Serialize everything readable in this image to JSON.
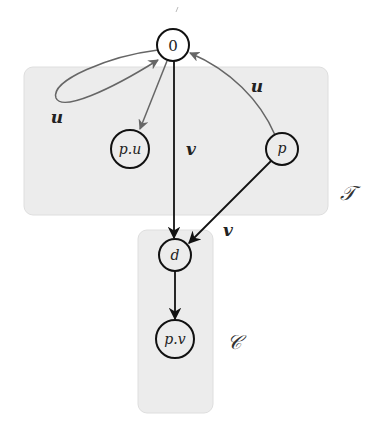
{
  "diagram": {
    "type": "directed-graph",
    "colors": {
      "region_fill": "#ececec",
      "dark_edge": "#111111",
      "gray_edge": "#666666"
    },
    "regions": [
      {
        "id": "T",
        "label": "𝒯",
        "x": 24,
        "y": 67,
        "w": 304,
        "h": 148
      },
      {
        "id": "C",
        "label": "𝒞",
        "x": 138,
        "y": 230,
        "w": 75,
        "h": 183
      }
    ],
    "nodes": [
      {
        "id": "0",
        "label": "0",
        "cx": 173,
        "cy": 45,
        "r": 16
      },
      {
        "id": "pu",
        "label": "p.u",
        "cx": 130,
        "cy": 149,
        "r": 19
      },
      {
        "id": "p",
        "label": "p",
        "cx": 282,
        "cy": 149,
        "r": 16
      },
      {
        "id": "d",
        "label": "d",
        "cx": 175,
        "cy": 255,
        "r": 16
      },
      {
        "id": "pv",
        "label": "p.v",
        "cx": 175,
        "cy": 339,
        "r": 19
      }
    ],
    "edges": [
      {
        "from": "0",
        "to": "0",
        "label": "u",
        "style": "gray",
        "kind": "loop"
      },
      {
        "from": "0",
        "to": "pu",
        "label": "",
        "style": "gray"
      },
      {
        "from": "p",
        "to": "0",
        "label": "u",
        "style": "gray",
        "kind": "curved"
      },
      {
        "from": "0",
        "to": "d",
        "label": "v",
        "style": "dark"
      },
      {
        "from": "p",
        "to": "d",
        "label": "v",
        "style": "dark"
      },
      {
        "from": "d",
        "to": "pv",
        "label": "",
        "style": "dark"
      }
    ],
    "labels": {
      "node_0": "0",
      "node_pu": "p.u",
      "node_p": "p",
      "node_d": "d",
      "node_pv": "p.v",
      "edge_loop_u": "u",
      "edge_p_0_u": "u",
      "edge_0_d_v": "v",
      "edge_p_d_v": "v",
      "region_T": "𝒯",
      "region_C": "𝒞"
    }
  }
}
